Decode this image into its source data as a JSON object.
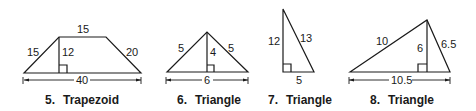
{
  "figures": [
    {
      "number": "5.",
      "name": "Trapezoid",
      "labels": {
        "top": "15",
        "left": "15",
        "height": "12",
        "right": "20",
        "base": "40"
      }
    },
    {
      "number": "6.",
      "name": "Triangle",
      "labels": {
        "left": "5",
        "height": "4",
        "right": "5",
        "base": "6"
      }
    },
    {
      "number": "7.",
      "name": "Triangle",
      "labels": {
        "leg": "12",
        "hypotenuse": "13",
        "base": "5"
      }
    },
    {
      "number": "8.",
      "name": "Triangle",
      "labels": {
        "left": "10",
        "height": "6",
        "right": "6.5",
        "base": "10.5"
      }
    }
  ]
}
